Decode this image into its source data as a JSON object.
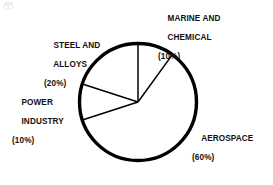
{
  "chart_data": {
    "type": "pie",
    "title": "",
    "categories": [
      "MARINE AND CHEMICAL",
      "AEROSPACE",
      "POWER INDUSTRY",
      "STEEL AND ALLOYS"
    ],
    "values": [
      10,
      60,
      10,
      20
    ],
    "value_unit": "%",
    "start_angle_deg": 0,
    "direction": "clockwise",
    "legend": "none",
    "grid": false,
    "slice_colors": [
      "#ffffff",
      "#ffffff",
      "#ffffff",
      "#ffffff"
    ],
    "outline_color": "#000000",
    "background_color": "#ffffff",
    "labels_position": "outside",
    "slices": [
      {
        "name": "MARINE AND CHEMICAL",
        "value": 10,
        "label_line1": "MARINE AND",
        "label_line2": "CHEMICAL",
        "label_pct": "(10%)",
        "start_deg": 0,
        "end_deg": 36
      },
      {
        "name": "AEROSPACE",
        "value": 60,
        "label_line1": "AEROSPACE",
        "label_line2": "",
        "label_pct": "(60%)",
        "start_deg": 36,
        "end_deg": 252
      },
      {
        "name": "POWER INDUSTRY",
        "value": 10,
        "label_line1": "POWER",
        "label_line2": "INDUSTRY",
        "label_pct": "(10%)",
        "start_deg": 252,
        "end_deg": 288
      },
      {
        "name": "STEEL AND ALLOYS",
        "value": 20,
        "label_line1": "STEEL AND",
        "label_line2": "ALLOYS",
        "label_pct": "(20%)",
        "start_deg": 288,
        "end_deg": 360
      }
    ]
  },
  "labels": {
    "marine": {
      "line1": "MARINE AND",
      "line2": "CHEMICAL",
      "pct": "(10%)"
    },
    "steel": {
      "line1": "STEEL AND",
      "line2": "ALLOYS",
      "pct": "(20%)"
    },
    "power": {
      "line1": "POWER",
      "line2": "INDUSTRY",
      "pct": "(10%)"
    },
    "aero": {
      "line1": "AEROSPACE",
      "line2": "",
      "pct": "(60%)"
    }
  }
}
